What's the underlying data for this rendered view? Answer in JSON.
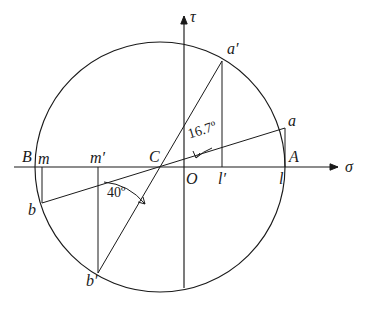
{
  "figure": {
    "kind": "mohr-circle",
    "background": "#ffffff",
    "stroke": "#1a1a1a",
    "width": 365,
    "height": 309
  },
  "axes": {
    "sigma": {
      "label": "σ",
      "label_x": 345,
      "label_y": 158,
      "x1": 14,
      "y1": 167,
      "x2": 338,
      "y2": 167
    },
    "tau": {
      "label": "τ",
      "label_x": 190,
      "label_y": 8,
      "x1": 184,
      "y1": 288,
      "x2": 184,
      "y2": 16
    },
    "origin": {
      "label": "O",
      "label_x": 186,
      "label_y": 170
    }
  },
  "circle": {
    "cx": 160,
    "cy": 167,
    "r": 125
  },
  "points": [
    {
      "name": "B",
      "label": "B",
      "x": 35,
      "y": 167,
      "label_x": 22,
      "label_y": 148,
      "on_axis": true
    },
    {
      "name": "A",
      "label": "A",
      "x": 285,
      "y": 167,
      "label_x": 289,
      "label_y": 148,
      "on_axis": true
    },
    {
      "name": "C",
      "label": "C",
      "x": 160,
      "y": 167,
      "label_x": 149,
      "label_y": 148,
      "on_axis": true
    },
    {
      "name": "m",
      "label": "m",
      "x": 42,
      "y": 167,
      "label_x": 38,
      "label_y": 150,
      "on_axis": true
    },
    {
      "name": "mp",
      "label": "m′",
      "x": 98,
      "y": 167,
      "label_x": 90,
      "label_y": 149,
      "on_axis": true
    },
    {
      "name": "lp",
      "label": "l′",
      "x": 222,
      "y": 167,
      "label_x": 218,
      "label_y": 170,
      "on_axis": true
    },
    {
      "name": "l",
      "label": "l",
      "x": 285,
      "y": 167,
      "label_x": 279,
      "label_y": 170,
      "on_axis": true
    },
    {
      "name": "a",
      "label": "a",
      "x": 285,
      "y": 128,
      "label_x": 288,
      "label_y": 112,
      "on_axis": false
    },
    {
      "name": "b",
      "label": "b",
      "x": 42,
      "y": 203,
      "label_x": 28,
      "label_y": 201,
      "on_axis": false
    },
    {
      "name": "ap",
      "label": "a′",
      "x": 222,
      "y": 61,
      "label_x": 227,
      "label_y": 40,
      "on_axis": false
    },
    {
      "name": "bp",
      "label": "b′",
      "x": 98,
      "y": 273,
      "label_x": 86,
      "label_y": 272,
      "on_axis": false
    }
  ],
  "chords": [
    {
      "name": "chord-ab",
      "x1": 42,
      "y1": 203,
      "x2": 285,
      "y2": 128
    },
    {
      "name": "chord-apbp",
      "x1": 98,
      "y1": 273,
      "x2": 222,
      "y2": 61
    }
  ],
  "droplines": [
    {
      "name": "dropline-m-b",
      "x1": 42,
      "y1": 167,
      "x2": 42,
      "y2": 203
    },
    {
      "name": "dropline-mp-bp",
      "x1": 98,
      "y1": 167,
      "x2": 98,
      "y2": 273
    },
    {
      "name": "dropline-lp-ap",
      "x1": 222,
      "y1": 167,
      "x2": 222,
      "y2": 61
    },
    {
      "name": "dropline-l-a",
      "x1": 285,
      "y1": 167,
      "x2": 285,
      "y2": 128
    }
  ],
  "angles": [
    {
      "name": "angle-16-7",
      "text": "16.7º",
      "x": 186,
      "y": 127,
      "rotate": -17
    },
    {
      "name": "angle-40",
      "text": "40º",
      "x": 107,
      "y": 185,
      "rotate": 0
    }
  ],
  "arcs": [
    {
      "name": "arc-16-7",
      "d": "M 212 148 A 52 52 0 0 0 196 158",
      "tip": "M 196 158 L 193 151 M 196 158 L 200 153"
    },
    {
      "name": "arc-40",
      "d": "M 104 182 A 60 60 0 0 1 145 204",
      "tip": "M 145 204 L 138 202 M 145 204 L 143 197"
    }
  ]
}
